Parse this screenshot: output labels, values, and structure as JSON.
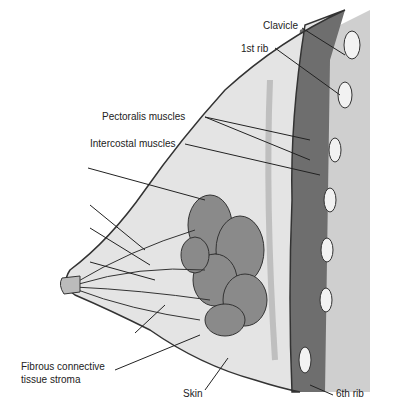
{
  "diagram": {
    "type": "anatomical cross-section (sagittal) of the breast",
    "labels": {
      "clavicle": "Clavicle",
      "first_rib": "1st rib",
      "pectoralis": "Pectoralis muscles",
      "intercostal": "Intercostal muscles",
      "stroma_line1": "Fibrous connective",
      "stroma_line2": "tissue stroma",
      "skin": "Skin",
      "sixth_rib": "6th rib"
    },
    "colors": {
      "muscle": "#6e6e6e",
      "gland": "#8a8a8a",
      "fat": "#e4e4e4",
      "chest_wall": "#cfcfcf",
      "rib": "#f2f2f2",
      "outline": "#333333"
    }
  }
}
